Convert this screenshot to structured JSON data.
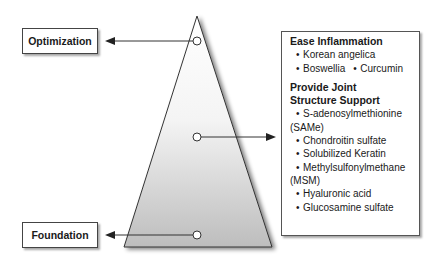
{
  "diagram": {
    "type": "pyramid",
    "levels": {
      "top": {
        "label": "Optimization"
      },
      "bottom": {
        "label": "Foundation"
      }
    },
    "info_box": {
      "sections": [
        {
          "title": "Ease Inflammation",
          "items": [
            "Korean angelica",
            "Boswellia",
            "Curcumin"
          ]
        },
        {
          "title_line1": "Provide Joint",
          "title_line2": "Structure Support",
          "items": [
            "S-adenosylmethionine",
            "(SAMe)",
            "Chondroitin sulfate",
            "Solubilized Keratin",
            "Methylsulfonylmethane",
            "(MSM)",
            "Hyaluronic acid",
            "Glucosamine sulfate"
          ]
        }
      ]
    },
    "colors": {
      "outline": "#333333",
      "gradient_top": "#ffffff",
      "gradient_bottom": "#bdbdbd"
    }
  }
}
